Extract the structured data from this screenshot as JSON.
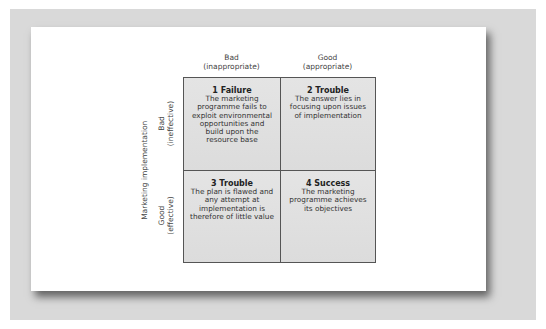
{
  "colors": {
    "frame_bg": "#d9d9d9",
    "card_bg": "#ffffff",
    "cell_bg": "#e0e0e0",
    "grid_line": "#555555",
    "text": "#333333"
  },
  "axes": {
    "column_labels": [
      {
        "line1": "Bad",
        "line2": "(inappropriate)"
      },
      {
        "line1": "Good",
        "line2": "(appropriate)"
      }
    ],
    "row_axis_title": "Marketing implementation",
    "row_labels": [
      {
        "line1": "Bad",
        "line2": "(ineffective)"
      },
      {
        "line1": "Good",
        "line2": "(effective)"
      }
    ]
  },
  "cells": [
    {
      "title": "1 Failure",
      "text": "The marketing programme fails to exploit environmental opportunities and build upon the resource base"
    },
    {
      "title": "2 Trouble",
      "text": "The answer lies in focusing upon issues of implementation"
    },
    {
      "title": "3 Trouble",
      "text": "The plan is flawed and any attempt at implementation is therefore of little value"
    },
    {
      "title": "4 Success",
      "text": "The marketing programme achieves its objectives"
    }
  ]
}
